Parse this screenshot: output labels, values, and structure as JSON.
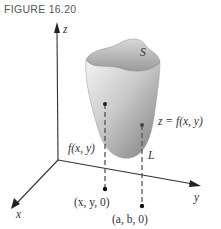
{
  "figure": {
    "title": "FIGURE 16.20"
  },
  "axes": {
    "z_label": "z",
    "x_label": "x",
    "y_label": "y"
  },
  "surface": {
    "name": "S",
    "equation": "z = f(x, y)",
    "fill_light": "#f2f2f2",
    "fill_dark": "#8a8a8a"
  },
  "annotations": {
    "height_label": "f(x, y)",
    "line_label": "L",
    "point_xy0": "(x, y, 0)",
    "point_ab0": "(a, b, 0)"
  },
  "colors": {
    "axis": "#333333",
    "text": "#333333",
    "dashed": "#555555"
  }
}
